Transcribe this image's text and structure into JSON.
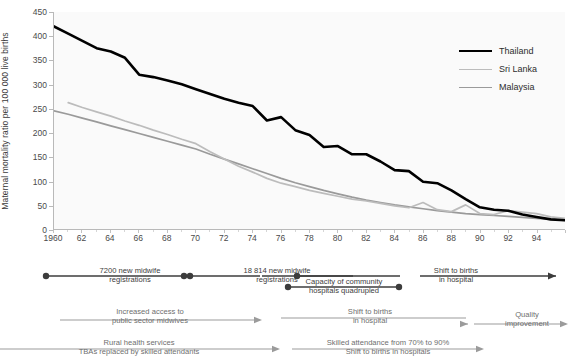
{
  "chart_data": {
    "type": "line",
    "title": "",
    "xlabel": "",
    "ylabel": "Maternal mortality ratio per 100 000 live births",
    "ylim": [
      0,
      450
    ],
    "xlim": [
      1960,
      1996
    ],
    "yticks": [
      0,
      50,
      100,
      150,
      200,
      250,
      300,
      350,
      400,
      450
    ],
    "xticks": [
      "1960",
      "62",
      "64",
      "66",
      "68",
      "70",
      "72",
      "74",
      "76",
      "78",
      "80",
      "82",
      "84",
      "86",
      "88",
      "90",
      "92",
      "94"
    ],
    "grid": false,
    "legend_position": "top-right",
    "x": [
      1960,
      1961,
      1962,
      1963,
      1964,
      1965,
      1966,
      1967,
      1968,
      1969,
      1970,
      1971,
      1972,
      1973,
      1974,
      1975,
      1976,
      1977,
      1978,
      1979,
      1980,
      1981,
      1982,
      1983,
      1984,
      1985,
      1986,
      1987,
      1988,
      1989,
      1990,
      1991,
      1992,
      1993,
      1994,
      1995,
      1996
    ],
    "series": [
      {
        "name": "Thailand",
        "color": "#000000",
        "values": [
          420,
          405,
          390,
          375,
          368,
          355,
          320,
          315,
          308,
          300,
          290,
          280,
          270,
          262,
          255,
          225,
          232,
          205,
          195,
          170,
          172,
          155,
          155,
          140,
          122,
          120,
          98,
          95,
          80,
          62,
          45,
          40,
          38,
          30,
          25,
          20,
          18
        ]
      },
      {
        "name": "Sri Lanka",
        "color": "#bcbcbc",
        "values": [
          null,
          262,
          252,
          243,
          234,
          224,
          215,
          205,
          196,
          186,
          177,
          160,
          145,
          130,
          118,
          105,
          95,
          88,
          80,
          74,
          68,
          62,
          58,
          53,
          48,
          44,
          55,
          40,
          36,
          50,
          32,
          30,
          38,
          35,
          32,
          25,
          22
        ]
      },
      {
        "name": "Malaysia",
        "color": "#9a9a9a",
        "values": [
          245,
          238,
          230,
          222,
          214,
          206,
          198,
          190,
          182,
          174,
          166,
          155,
          145,
          135,
          125,
          115,
          105,
          96,
          88,
          80,
          73,
          66,
          60,
          55,
          50,
          46,
          42,
          38,
          35,
          32,
          30,
          28,
          26,
          24,
          22,
          20,
          18
        ]
      }
    ]
  },
  "legend": {
    "items": [
      {
        "label": "Thailand",
        "key": "thailand"
      },
      {
        "label": "Sri Lanka",
        "key": "srilanka"
      },
      {
        "label": "Malaysia",
        "key": "malaysia"
      }
    ]
  },
  "annotations": {
    "row1": [
      {
        "text_line1": "7200 new midwife",
        "text_line2": "registrations"
      },
      {
        "text_line1": "18 814 new midwife",
        "text_line2": "registrations"
      },
      {
        "text_line1": "Capacity of community",
        "text_line2": "hospitals quadrupled"
      },
      {
        "text_line1": "Shift to births",
        "text_line2": "in hospital"
      }
    ],
    "row2": [
      {
        "text_line1": "Increased access to",
        "text_line2": "public sector midwives"
      },
      {
        "text_line1": "Shift to births",
        "text_line2": "in hospital"
      },
      {
        "text_line1": "Quality",
        "text_line2": "improvement"
      }
    ],
    "row3": [
      {
        "text_line1": "Rural health services",
        "text_line2": "TBAs replaced by skilled attendants"
      },
      {
        "text_line1": "Skilled attendance from 70% to 90%",
        "text_line2": "Shift to births in hospitals"
      }
    ]
  },
  "colors": {
    "thailand": "#000000",
    "srilanka": "#bcbcbc",
    "malaysia": "#9a9a9a",
    "axis": "#b9b9b9",
    "plot_bg": "#fafafa",
    "annotation_dark": "#3c3c3c",
    "annotation_light": "#9b9b9b"
  }
}
